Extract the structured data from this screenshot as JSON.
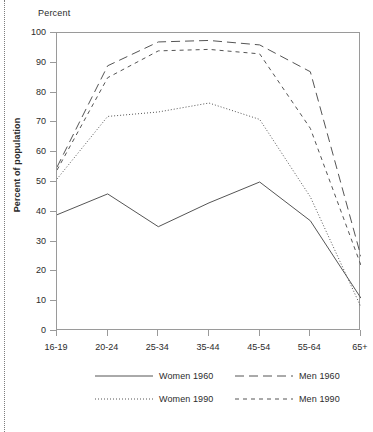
{
  "chart_data": {
    "type": "line",
    "title": "",
    "unit_label": "Percent",
    "ylabel": "Percent of population",
    "xlabel": "",
    "categories": [
      "16-19",
      "20-24",
      "25-34",
      "35-44",
      "45-54",
      "55-64",
      "65+"
    ],
    "ylim": [
      0,
      100
    ],
    "yticks": [
      0,
      10,
      20,
      30,
      40,
      50,
      60,
      70,
      80,
      90,
      100
    ],
    "grid": false,
    "legend_position": "bottom",
    "series": [
      {
        "name": "Women 1960",
        "style": "solid",
        "color": "#555555",
        "values": [
          39,
          46,
          35,
          43,
          50,
          37,
          11
        ]
      },
      {
        "name": "Men 1960",
        "style": "long-dash",
        "color": "#555555",
        "values": [
          55,
          89,
          97,
          97.5,
          96,
          87,
          25
        ]
      },
      {
        "name": "Women 1990",
        "style": "dotted",
        "color": "#555555",
        "values": [
          51,
          72,
          73.5,
          76.5,
          71,
          45,
          8
        ]
      },
      {
        "name": "Men 1990",
        "style": "dashed",
        "color": "#555555",
        "values": [
          54,
          85,
          94,
          94.5,
          93,
          68,
          22
        ]
      }
    ]
  },
  "legend": {
    "entries": [
      {
        "label": "Women 1960",
        "style": "solid"
      },
      {
        "label": "Men 1960",
        "style": "long-dash"
      },
      {
        "label": "Women 1990",
        "style": "dotted"
      },
      {
        "label": "Men 1990",
        "style": "dashed"
      }
    ]
  },
  "colors": {
    "line": "#555555",
    "axis": "#9a9a9a",
    "text": "#2b2b2b"
  }
}
